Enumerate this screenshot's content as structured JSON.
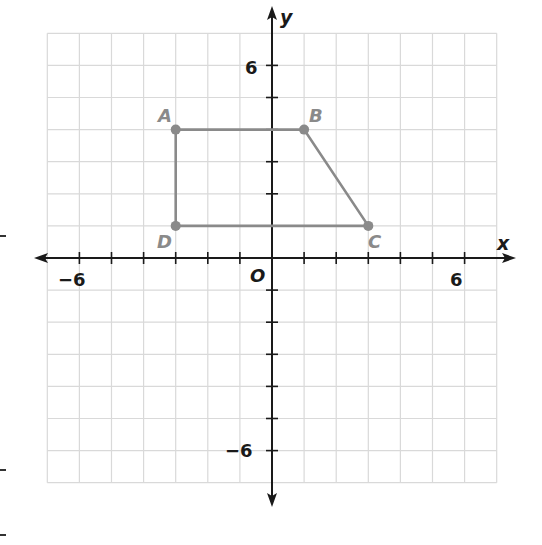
{
  "diagram": {
    "type": "coordinate-plane",
    "axes": {
      "x_label": "x",
      "y_label": "y",
      "origin_label": "O"
    },
    "ticks": {
      "x_labels": [
        "−6",
        "6"
      ],
      "y_labels": [
        "6",
        "−6"
      ]
    },
    "range": {
      "xmin": -7,
      "xmax": 7,
      "ymin": -7,
      "ymax": 7
    },
    "polygon": {
      "name": "ABCD",
      "stroke": "#8a8a8a",
      "vertices": [
        {
          "label": "A",
          "x": -3,
          "y": 4
        },
        {
          "label": "B",
          "x": 1,
          "y": 4
        },
        {
          "label": "C",
          "x": 3,
          "y": 1
        },
        {
          "label": "D",
          "x": -3,
          "y": 1
        }
      ]
    },
    "colors": {
      "grid": "#d9d9d9",
      "axis": "#1a1a1a",
      "shape": "#8a8a8a"
    }
  },
  "chart_data": {
    "type": "scatter",
    "title": "",
    "xlabel": "x",
    "ylabel": "y",
    "xlim": [
      -7,
      7
    ],
    "ylim": [
      -7,
      7
    ],
    "grid": true,
    "series": [
      {
        "name": "ABCD",
        "points": [
          {
            "label": "A",
            "x": -3,
            "y": 4
          },
          {
            "label": "B",
            "x": 1,
            "y": 4
          },
          {
            "label": "C",
            "x": 3,
            "y": 1
          },
          {
            "label": "D",
            "x": -3,
            "y": 1
          }
        ],
        "closed": true
      }
    ]
  }
}
